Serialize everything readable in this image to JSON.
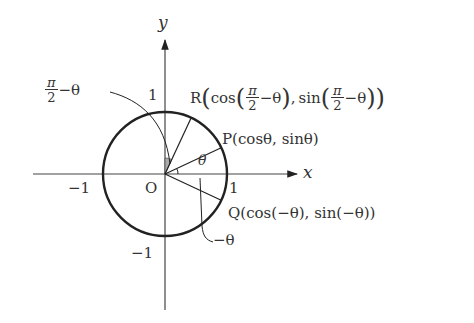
{
  "figure": {
    "type": "unit-circle",
    "axes": {
      "x_label": "x",
      "y_label": "y",
      "origin_label": "O",
      "ticks": {
        "x_pos": "1",
        "x_neg": "−1",
        "y_pos": "1",
        "y_neg": "−1"
      }
    },
    "points": {
      "P": {
        "name": "P",
        "coords": "(cosθ, sinθ)"
      },
      "Q": {
        "name": "Q",
        "coords": "(cos(−θ), sin(−θ))"
      },
      "R": {
        "name": "R",
        "cos_word": "cos",
        "sin_word": "sin",
        "pi": "π",
        "two": "2",
        "minus_theta": "−θ",
        "comma": ","
      }
    },
    "angles": {
      "theta": "θ",
      "neg_theta": "−θ",
      "complement": {
        "pi": "π",
        "two": "2",
        "minus_theta": "−θ"
      }
    },
    "colors": {
      "stroke": "#222222",
      "shade": "#999999",
      "text": "#333333"
    }
  }
}
